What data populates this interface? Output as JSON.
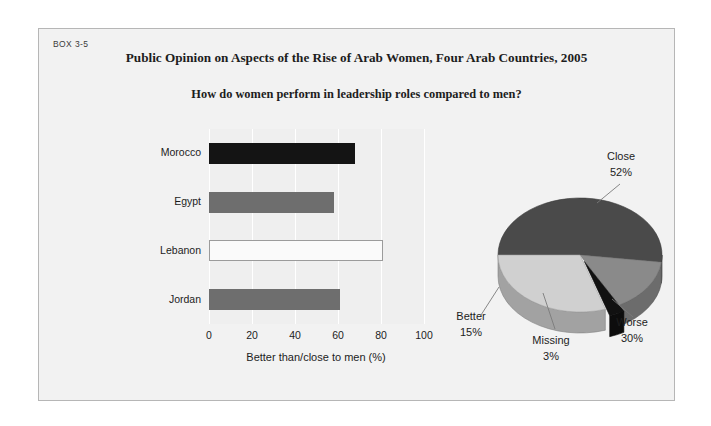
{
  "box": {
    "label": "BOX 3-5",
    "title": "Public Opinion on Aspects of the Rise of Arab Women, Four Arab Countries, 2005",
    "subtitle": "How do women perform in leadership roles compared to men?"
  },
  "colors": {
    "page_background": "#ffffff",
    "panel_background": "#f2f2f2",
    "panel_border": "#b6b6b6",
    "plot_background": "#efefef",
    "gridline": "#ffffff",
    "bar_dark": "#141414",
    "bar_mid": "#6e6e6e",
    "bar_open_fill": "#fafafa",
    "bar_open_border": "#9b9b9b",
    "pie_close": "#4a4a4a",
    "pie_worse": "#d0d0d0",
    "pie_better": "#8a8a8a",
    "pie_missing": "#111111",
    "leader_line": "#7a7a7a",
    "text": "#1d1d1d"
  },
  "chart_data": [
    {
      "type": "bar",
      "orientation": "horizontal",
      "title": "",
      "xlabel": "Better than/close to men (%)",
      "ylabel": "",
      "xlim": [
        0,
        100
      ],
      "xticks": [
        0,
        20,
        40,
        60,
        80,
        100
      ],
      "xtick_labels": [
        "0",
        "20",
        "40",
        "60",
        "80",
        "100"
      ],
      "grid": true,
      "legend": "none",
      "categories": [
        "Morocco",
        "Egypt",
        "Lebanon",
        "Jordan"
      ],
      "values": [
        68,
        58,
        81,
        61
      ],
      "bar_styles": [
        "dark",
        "mid",
        "open",
        "mid"
      ]
    },
    {
      "type": "pie",
      "title": "",
      "three_d": true,
      "legend": "labels-with-leader-lines",
      "labels": [
        "Close",
        "Worse",
        "Missing",
        "Better"
      ],
      "values": [
        52,
        30,
        3,
        15
      ],
      "value_labels": [
        "52%",
        "30%",
        "3%",
        "15%"
      ],
      "slice_colors": [
        "#4a4a4a",
        "#d0d0d0",
        "#111111",
        "#8a8a8a"
      ],
      "exploded": [
        "Missing"
      ]
    }
  ]
}
